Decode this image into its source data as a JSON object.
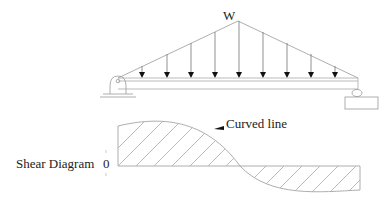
{
  "diagram": {
    "load_label": "W",
    "annotation_label": "Curved line",
    "shear_label": "Shear Diagram",
    "zero_label": "0",
    "load_type": "triangular distributed load",
    "arrow_count": 9,
    "supports": [
      "pin (left)",
      "roller (right)"
    ],
    "colors": {
      "line": "#888888",
      "arrow": "#111111",
      "text": "#222222"
    }
  }
}
